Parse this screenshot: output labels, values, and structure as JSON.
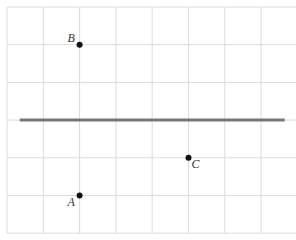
{
  "diagram": {
    "grid": {
      "columns": 8,
      "rows": 6,
      "line_color": "#dcdcdc"
    },
    "line": {
      "color": "#777777",
      "from": [
        0.35,
        3
      ],
      "to": [
        7.65,
        3
      ]
    },
    "points": [
      {
        "label": "B",
        "x": 2,
        "y": 1
      },
      {
        "label": "C",
        "x": 5,
        "y": 4
      },
      {
        "label": "A",
        "x": 2,
        "y": 5
      }
    ],
    "point_color": "#111111"
  }
}
